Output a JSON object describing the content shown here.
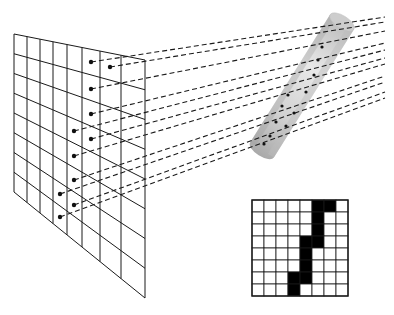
{
  "figure": {
    "colors": {
      "line": "#1a1a1a",
      "dot": "#111111",
      "cylinder_light": "#e6e6e6",
      "cylinder_mid": "#cfcfcf",
      "cylinder_dark": "#a8a8a8",
      "pixel_on": "#000000",
      "pixel_off": "#ffffff"
    }
  },
  "projection_grid": {
    "rows": 8,
    "cols": 8,
    "corners": {
      "tl": [
        14,
        34
      ],
      "tr": [
        145,
        60
      ],
      "br": [
        145,
        298
      ],
      "bl": [
        14,
        192
      ]
    },
    "dots": [
      [
        91,
        62
      ],
      [
        110,
        67
      ],
      [
        91,
        89
      ],
      [
        91,
        114
      ],
      [
        74,
        131
      ],
      [
        91,
        139
      ],
      [
        74,
        156
      ],
      [
        74,
        180
      ],
      [
        60,
        194
      ],
      [
        74,
        205
      ],
      [
        60,
        217
      ]
    ]
  },
  "cylinder": {
    "top": [
      342,
      22
    ],
    "bottom": [
      262,
      150
    ],
    "radius": 14
  },
  "rays": [
    {
      "from": [
        91,
        62
      ],
      "to": [
        385,
        17
      ]
    },
    {
      "from": [
        110,
        67
      ],
      "to": [
        385,
        22
      ]
    },
    {
      "from": [
        91,
        89
      ],
      "to": [
        385,
        31
      ]
    },
    {
      "from": [
        91,
        114
      ],
      "to": [
        385,
        43
      ]
    },
    {
      "from": [
        74,
        131
      ],
      "to": [
        385,
        50
      ]
    },
    {
      "from": [
        91,
        139
      ],
      "to": [
        385,
        58
      ]
    },
    {
      "from": [
        74,
        156
      ],
      "to": [
        385,
        64
      ]
    },
    {
      "from": [
        74,
        180
      ],
      "to": [
        385,
        76
      ]
    },
    {
      "from": [
        60,
        194
      ],
      "to": [
        385,
        82
      ]
    },
    {
      "from": [
        74,
        205
      ],
      "to": [
        385,
        92
      ]
    },
    {
      "from": [
        60,
        217
      ],
      "to": [
        385,
        98
      ]
    }
  ],
  "pixel_image": {
    "rows": 8,
    "cols": 8,
    "origin": [
      252,
      200
    ],
    "cell": 12,
    "filled": [
      [
        0,
        5
      ],
      [
        0,
        6
      ],
      [
        1,
        5
      ],
      [
        2,
        5
      ],
      [
        3,
        4
      ],
      [
        3,
        5
      ],
      [
        4,
        4
      ],
      [
        5,
        4
      ],
      [
        6,
        3
      ],
      [
        6,
        4
      ],
      [
        7,
        3
      ]
    ]
  }
}
